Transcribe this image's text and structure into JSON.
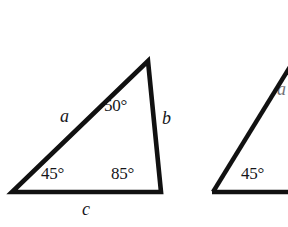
{
  "figure": {
    "background_color": "#ffffff",
    "stroke_color": "#111111",
    "text_color": "#16161a",
    "stroke_width": 4.5
  },
  "triangles": [
    {
      "id": "triangle-left",
      "complete": true,
      "vertices": {
        "apex": {
          "x": 148,
          "y": 60
        },
        "bottom_left": {
          "x": 11,
          "y": 193
        },
        "bottom_right": {
          "x": 162,
          "y": 193
        }
      },
      "angles": {
        "apex": "50°",
        "bottom_left": "45°",
        "bottom_right": "85°"
      },
      "sides": {
        "left": "a",
        "right": "b",
        "bottom": "c"
      }
    },
    {
      "id": "triangle-right-cropped",
      "complete": false,
      "note": "partially visible, clipped by right edge of image",
      "vertices": {
        "apex": {
          "x": 297,
          "y": 57
        },
        "bottom_left": {
          "x": 212,
          "y": 193
        },
        "bottom_right": {
          "x": 310,
          "y": 193
        }
      },
      "angles": {
        "bottom_left": "45°"
      },
      "sides": {
        "left": "a"
      }
    }
  ]
}
